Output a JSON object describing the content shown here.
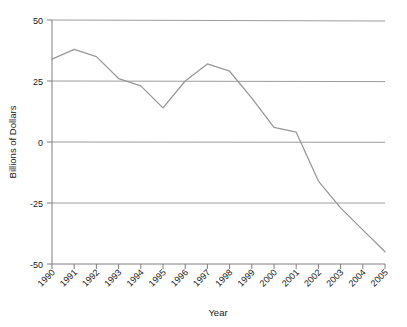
{
  "chart_data": {
    "type": "line",
    "title": "",
    "xlabel": "Year",
    "ylabel": "Billions of Dollars",
    "x": [
      1990,
      1991,
      1992,
      1993,
      1994,
      1995,
      1996,
      1997,
      1998,
      1999,
      2000,
      2001,
      2002,
      2003,
      2004,
      2005
    ],
    "categories": [
      "1990",
      "1991",
      "1992",
      "1993",
      "1994",
      "1995",
      "1996",
      "1997",
      "1998",
      "1999",
      "2000",
      "2001",
      "2002",
      "2003",
      "2004",
      "2005"
    ],
    "values": [
      34,
      38,
      35,
      26,
      23,
      14,
      25,
      32,
      29,
      18,
      6,
      4,
      -16,
      -27,
      -36,
      -45
    ],
    "series": [
      {
        "name": "Billions of Dollars",
        "values": [
          34,
          38,
          35,
          26,
          23,
          14,
          25,
          32,
          29,
          18,
          6,
          4,
          -16,
          -27,
          -36,
          -45
        ]
      }
    ],
    "ylim": [
      -50,
      50
    ],
    "yticks": [
      50,
      25,
      0,
      -25,
      -50
    ],
    "ytick_labels": [
      "50",
      "25",
      "0",
      "-25",
      "-50"
    ],
    "xtick_labels": [
      "1990",
      "1991",
      "1992",
      "1993",
      "1994",
      "1995",
      "1996",
      "1997",
      "1998",
      "1999",
      "2000",
      "2001",
      "2002",
      "2003",
      "2004",
      "2005"
    ],
    "xtick_rotation": 45,
    "grid": true,
    "grid_axis": "y",
    "legend": false,
    "legend_position": "none",
    "colors": {
      "line": "#999999",
      "grid": "#999999",
      "axis": "#808080",
      "text": "#1a1a1a",
      "background": "#ffffff"
    }
  }
}
